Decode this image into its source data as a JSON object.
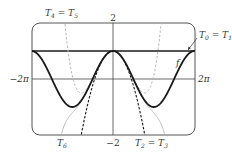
{
  "chart_data": {
    "type": "line",
    "title": "",
    "xlabel": "",
    "ylabel": "",
    "xlim": [
      "-2π",
      "2π"
    ],
    "ylim": [
      -2,
      2
    ],
    "tick_labels": {
      "x_left": "−2π",
      "x_right": "2π",
      "y_top": "2",
      "y_bottom": "−2"
    },
    "grid": false,
    "series": [
      {
        "name": "f",
        "expression": "cos x",
        "style": "thick solid black"
      },
      {
        "name": "T0 = T1",
        "expression": "1",
        "style": "solid black"
      },
      {
        "name": "T2 = T3",
        "expression": "1 − x²/2",
        "style": "dashed black"
      },
      {
        "name": "T4 = T5",
        "expression": "1 − x²/2 + x⁴/24",
        "style": "dashed gray"
      },
      {
        "name": "T6",
        "expression": "1 − x²/2 + x⁴/24 − x⁶/720",
        "style": "thin solid gray"
      }
    ],
    "annotations": [
      {
        "text": "T4 = T5",
        "position": "top-left"
      },
      {
        "text": "T0 = T1",
        "position": "top-right",
        "arrow": true
      },
      {
        "text": "f",
        "position": "right, near curve"
      },
      {
        "text": "T6",
        "position": "bottom-left"
      },
      {
        "text": "T2 = T3",
        "position": "bottom-center-right"
      }
    ]
  },
  "labels": {
    "y_top": "2",
    "y_bottom": "−2",
    "x_left": "−2π",
    "x_right": "2π",
    "f": "f",
    "t0t1": {
      "a": "T",
      "a_sub": "0",
      "eq": " = ",
      "b": "T",
      "b_sub": "1"
    },
    "t4t5": {
      "a": "T",
      "a_sub": "4",
      "eq": " = ",
      "b": "T",
      "b_sub": "5"
    },
    "t2t3": {
      "a": "T",
      "a_sub": "2",
      "eq": " = ",
      "b": "T",
      "b_sub": "3"
    },
    "t6": {
      "a": "T",
      "a_sub": "6"
    }
  },
  "colors": {
    "frame": "#555555",
    "axis": "#333333",
    "f": "#1a1a1a",
    "t2": "#1a1a1a",
    "t4": "#b5b5b5",
    "t6": "#b5b5b5"
  }
}
